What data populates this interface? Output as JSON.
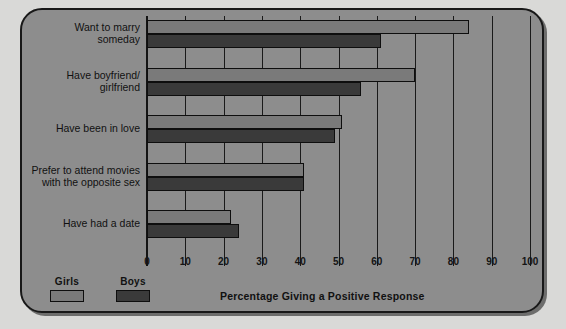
{
  "chart_data": {
    "type": "bar",
    "orientation": "horizontal",
    "title": "",
    "xlabel": "Percentage Giving a Positive Response",
    "ylabel": "",
    "xlim": [
      0,
      100
    ],
    "xticks": [
      0,
      10,
      20,
      30,
      40,
      50,
      60,
      70,
      80,
      90,
      100
    ],
    "xtick_labels": [
      "0",
      "10",
      "20",
      "30",
      "40",
      "50",
      "60",
      "70",
      "80",
      "90",
      "100"
    ],
    "grid": true,
    "legend_position": "bottom-left",
    "categories": [
      "Want to marry someday",
      "Have boyfriend/ girlfriend",
      "Have been in love",
      "Prefer to attend movies with the opposite sex",
      "Have had a date"
    ],
    "category_lines": [
      [
        "Want to marry",
        "someday"
      ],
      [
        "Have boyfriend/",
        "girlfriend"
      ],
      [
        "Have been in love"
      ],
      [
        "Prefer to attend movies",
        "with the opposite sex"
      ],
      [
        "Have had a date"
      ]
    ],
    "series": [
      {
        "name": "Girls",
        "color": "#7a7a7a",
        "values": [
          84,
          70,
          51,
          41,
          22
        ]
      },
      {
        "name": "Boys",
        "color": "#3a3a3a",
        "values": [
          61,
          56,
          49,
          41,
          24
        ]
      }
    ]
  },
  "legend": {
    "items": [
      {
        "label": "Girls"
      },
      {
        "label": "Boys"
      }
    ]
  },
  "colors": {
    "panel_background": "#8d8d8d",
    "page_background": "#d9d9d7",
    "girls_bar": "#7a7a7a",
    "boys_bar": "#3a3a3a",
    "ink": "#141414"
  }
}
